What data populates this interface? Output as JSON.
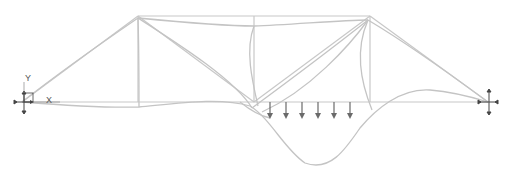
{
  "diagram": {
    "title": "",
    "type": "truss-deformed-shape",
    "axes": {
      "x_label": "X",
      "y_label": "Y"
    },
    "colors": {
      "undeformed": "#c8c8c8",
      "deformed": "#c4c4c4",
      "load": "#6a6a6a",
      "support": "#444444",
      "background": "#ffffff"
    },
    "nodes": [
      {
        "id": "left-support",
        "x": 22,
        "y": 102
      },
      {
        "id": "top-left",
        "x": 138,
        "y": 16
      },
      {
        "id": "top-mid",
        "x": 254,
        "y": 16
      },
      {
        "id": "top-right",
        "x": 370,
        "y": 16
      },
      {
        "id": "bottom-left",
        "x": 138,
        "y": 102
      },
      {
        "id": "bottom-mid",
        "x": 254,
        "y": 102
      },
      {
        "id": "bottom-right",
        "x": 370,
        "y": 102
      },
      {
        "id": "right-support",
        "x": 488,
        "y": 102
      }
    ],
    "members": [
      [
        "left-support",
        "top-left"
      ],
      [
        "top-left",
        "top-mid"
      ],
      [
        "top-mid",
        "top-right"
      ],
      [
        "top-right",
        "right-support"
      ],
      [
        "left-support",
        "bottom-left"
      ],
      [
        "bottom-left",
        "bottom-mid"
      ],
      [
        "bottom-mid",
        "bottom-right"
      ],
      [
        "bottom-right",
        "right-support"
      ],
      [
        "top-left",
        "bottom-left"
      ],
      [
        "top-mid",
        "bottom-mid"
      ],
      [
        "top-right",
        "bottom-right"
      ],
      [
        "top-left",
        "bottom-mid"
      ],
      [
        "bottom-mid",
        "top-right"
      ]
    ],
    "distributed_load": {
      "arrow_x": [
        270,
        286,
        302,
        318,
        334,
        350
      ],
      "y_start": 102,
      "y_end": 119
    },
    "supports": [
      {
        "id": "left-support",
        "type": "pinned"
      },
      {
        "id": "right-support",
        "type": "pinned"
      }
    ]
  }
}
